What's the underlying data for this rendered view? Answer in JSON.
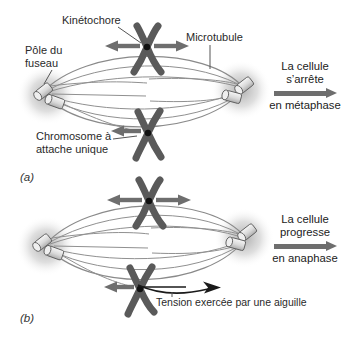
{
  "figure": {
    "panel_a": {
      "tag": "(a)",
      "labels": {
        "kinetochore": "Kinétochore",
        "microtubule": "Microtubule",
        "pole_line1": "Pôle du",
        "pole_line2": "fuseau",
        "chromosome_line1": "Chromosome à",
        "chromosome_line2": "attache unique"
      },
      "outcome": {
        "line1": "La cellule",
        "line2": "s’arrête",
        "line3": "en métaphase"
      }
    },
    "panel_b": {
      "tag": "(b)",
      "labels": {
        "tension": "Tension exercée par une aiguille"
      },
      "outcome": {
        "line1": "La cellule",
        "line2": "progresse",
        "line3": "en anaphase"
      }
    },
    "colors": {
      "chromosome": "#5a5a5a",
      "kinetochore_dot": "#111111",
      "arrow_gray": "#6e6e6e",
      "fiber": "#8f8f8f",
      "needle_black": "#1a1a1a",
      "text": "#2a2a2a",
      "background": "#ffffff"
    }
  }
}
